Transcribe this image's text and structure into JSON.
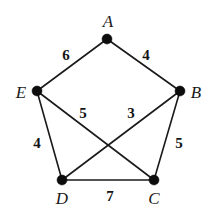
{
  "figure": {
    "type": "weighted-undirected-graph",
    "background_color": "#ffffff",
    "ink_color": "#1a1a1a",
    "width": 215,
    "height": 219
  },
  "vertices": [
    {
      "id": "A",
      "label": "A",
      "x": 107,
      "y": 39,
      "label_x": 108,
      "label_y": 21
    },
    {
      "id": "B",
      "label": "B",
      "x": 180,
      "y": 91,
      "label_x": 196,
      "label_y": 92
    },
    {
      "id": "C",
      "label": "C",
      "x": 154,
      "y": 180,
      "label_x": 154,
      "label_y": 198
    },
    {
      "id": "D",
      "label": "D",
      "x": 62,
      "y": 180,
      "label_x": 62,
      "label_y": 198
    },
    {
      "id": "E",
      "label": "E",
      "x": 37,
      "y": 91,
      "label_x": 21,
      "label_y": 92
    }
  ],
  "edges": [
    {
      "from": "A",
      "to": "E",
      "weight": "6",
      "label_x": 66,
      "label_y": 55
    },
    {
      "from": "A",
      "to": "B",
      "weight": "4",
      "label_x": 146,
      "label_y": 55
    },
    {
      "from": "E",
      "to": "D",
      "weight": "4",
      "label_x": 37,
      "label_y": 143
    },
    {
      "from": "E",
      "to": "C",
      "weight": "5",
      "label_x": 83,
      "label_y": 113
    },
    {
      "from": "B",
      "to": "D",
      "weight": "3",
      "label_x": 131,
      "label_y": 113
    },
    {
      "from": "B",
      "to": "C",
      "weight": "5",
      "label_x": 179,
      "label_y": 143
    },
    {
      "from": "D",
      "to": "C",
      "weight": "7",
      "label_x": 110,
      "label_y": 196
    }
  ]
}
